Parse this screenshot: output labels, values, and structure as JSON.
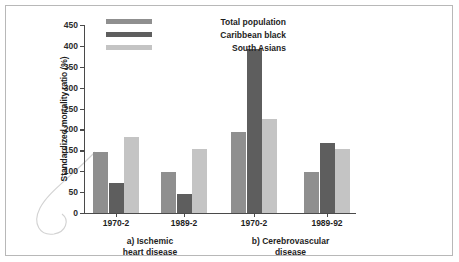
{
  "chart_data": {
    "type": "bar",
    "title": "",
    "xlabel": "",
    "ylabel": "Standardized mortality ratio (%)",
    "ylim": [
      0,
      450
    ],
    "ytick_labels": [
      "450",
      "400",
      "350",
      "300",
      "250",
      "200",
      "150",
      "100",
      "50",
      "0"
    ],
    "yticks": [
      450,
      400,
      350,
      300,
      250,
      200,
      150,
      100,
      50,
      0
    ],
    "grid": false,
    "legend_position": "top-left",
    "legend": [
      "Total population",
      "Caribbean black",
      "South Asians"
    ],
    "colors": {
      "total_population": "#8f8f8f",
      "caribbean_black": "#5e5e5e",
      "south_asians": "#c4c4c4",
      "axis": "#4a4a4a",
      "frame": "#b8b8b8",
      "text": "#1e1e1e"
    },
    "panels": [
      {
        "caption_line1": "a) Ischemic",
        "caption_line2": "heart disease",
        "categories": [
          "1970-2",
          "1989-2"
        ],
        "series": [
          {
            "name": "Total population",
            "values": [
              146,
              99
            ]
          },
          {
            "name": "Caribbean black",
            "values": [
              72,
              46
            ]
          },
          {
            "name": "South Asians",
            "values": [
              183,
              153
            ]
          }
        ]
      },
      {
        "caption_line1": "b) Cerebrovascular",
        "caption_line2": "disease",
        "categories": [
          "1970-2",
          "1989-92"
        ],
        "series": [
          {
            "name": "Total population",
            "values": [
              194,
              98
            ]
          },
          {
            "name": "Caribbean black",
            "values": [
              392,
              167
            ]
          },
          {
            "name": "South Asians",
            "values": [
              225,
              153
            ]
          }
        ]
      }
    ]
  }
}
